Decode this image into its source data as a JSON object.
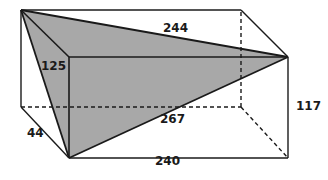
{
  "figure": {
    "shape_type": "cuboid-with-inscribed-tetrahedron",
    "colors": {
      "background": "#ffffff",
      "fill_shaded": "#a8a8a8",
      "stroke_solid": "#1a1a1a",
      "stroke_hidden": "#1a1a1a",
      "label_text": "#1a1a1a"
    },
    "labels": [
      {
        "name": "edge-244",
        "text": "244",
        "x": 163,
        "y": 22
      },
      {
        "name": "edge-125",
        "text": "125",
        "x": 41,
        "y": 60
      },
      {
        "name": "edge-117",
        "text": "117",
        "x": 296,
        "y": 100
      },
      {
        "name": "edge-267",
        "text": "267",
        "x": 160,
        "y": 113
      },
      {
        "name": "edge-44",
        "text": "44",
        "x": 27,
        "y": 127
      },
      {
        "name": "edge-240",
        "text": "240",
        "x": 155,
        "y": 155
      }
    ],
    "vertices": {
      "back_top_left": [
        21,
        10
      ],
      "back_top_right": [
        241,
        10
      ],
      "front_top_left": [
        69,
        57
      ],
      "front_top_right": [
        288,
        57
      ],
      "back_bottom_left": [
        21,
        107
      ],
      "back_bottom_right": [
        241,
        107
      ],
      "front_bottom_left": [
        69,
        158
      ],
      "front_bottom_right": [
        288,
        158
      ]
    },
    "shaded_solid_vertices": [
      "back_top_left",
      "front_top_left",
      "front_top_right",
      "front_bottom_left"
    ],
    "measurements": {
      "top_diagonal": "244",
      "left_slant": "125",
      "right_height": "117",
      "face_diagonal": "267",
      "depth": "44",
      "length": "240"
    }
  }
}
